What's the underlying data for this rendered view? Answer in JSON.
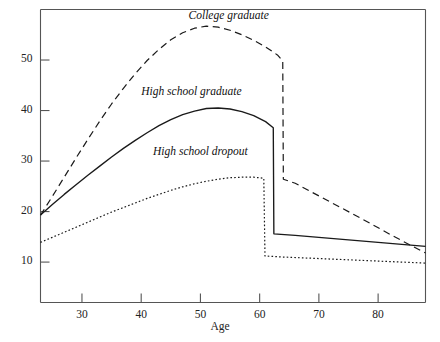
{
  "chart_data": {
    "type": "line",
    "title": "",
    "xlabel": "Age",
    "ylabel": "",
    "xlim": [
      23,
      88
    ],
    "ylim": [
      2,
      60
    ],
    "grid": false,
    "legend_position": "inline-annotations",
    "xticks": [
      30,
      40,
      50,
      60,
      70,
      80
    ],
    "xtick_labels": [
      "30",
      "40",
      "50",
      "60",
      "70",
      "80"
    ],
    "yticks": [
      10,
      20,
      30,
      40,
      50
    ],
    "ytick_labels": [
      "10",
      "20",
      "30",
      "40",
      "50"
    ],
    "series": [
      {
        "name": "College graduate",
        "style": "dashed",
        "label_x": 48,
        "label_y": 58.5,
        "points": [
          [
            23,
            19.3
          ],
          [
            25,
            23.0
          ],
          [
            27,
            26.8
          ],
          [
            29,
            30.6
          ],
          [
            31,
            34.3
          ],
          [
            33,
            37.9
          ],
          [
            35,
            41.3
          ],
          [
            37,
            44.4
          ],
          [
            39,
            47.3
          ],
          [
            41,
            49.9
          ],
          [
            43,
            52.1
          ],
          [
            45,
            54.0
          ],
          [
            47,
            55.4
          ],
          [
            49,
            56.3
          ],
          [
            51,
            56.7
          ],
          [
            53,
            56.5
          ],
          [
            55,
            55.9
          ],
          [
            57,
            55.0
          ],
          [
            59,
            53.9
          ],
          [
            61,
            52.6
          ],
          [
            63,
            51.0
          ],
          [
            63.9,
            49.8
          ],
          [
            64.0,
            26.4
          ],
          [
            66,
            25.6
          ],
          [
            70,
            23.1
          ],
          [
            74,
            20.6
          ],
          [
            78,
            18.1
          ],
          [
            82,
            15.5
          ],
          [
            86,
            13.0
          ],
          [
            88,
            11.8
          ]
        ]
      },
      {
        "name": "High school graduate",
        "style": "solid",
        "label_x": 40,
        "label_y": 43.5,
        "points": [
          [
            23,
            19.3
          ],
          [
            25,
            21.4
          ],
          [
            27,
            23.4
          ],
          [
            29,
            25.3
          ],
          [
            31,
            27.2
          ],
          [
            33,
            29.0
          ],
          [
            35,
            30.8
          ],
          [
            37,
            32.5
          ],
          [
            39,
            34.1
          ],
          [
            41,
            35.6
          ],
          [
            43,
            37.0
          ],
          [
            45,
            38.2
          ],
          [
            47,
            39.2
          ],
          [
            49,
            39.9
          ],
          [
            51,
            40.4
          ],
          [
            53,
            40.5
          ],
          [
            55,
            40.3
          ],
          [
            57,
            39.8
          ],
          [
            59,
            39.0
          ],
          [
            61,
            37.8
          ],
          [
            62.3,
            36.6
          ],
          [
            62.4,
            15.6
          ],
          [
            66,
            15.3
          ],
          [
            70,
            14.9
          ],
          [
            74,
            14.5
          ],
          [
            78,
            14.1
          ],
          [
            82,
            13.7
          ],
          [
            86,
            13.3
          ],
          [
            88,
            13.1
          ]
        ]
      },
      {
        "name": "High school dropout",
        "style": "dotted",
        "label_x": 42,
        "label_y": 31.5,
        "points": [
          [
            23,
            13.9
          ],
          [
            25,
            14.9
          ],
          [
            27,
            15.9
          ],
          [
            29,
            16.9
          ],
          [
            31,
            17.9
          ],
          [
            33,
            18.9
          ],
          [
            35,
            19.9
          ],
          [
            37,
            20.8
          ],
          [
            39,
            21.7
          ],
          [
            41,
            22.6
          ],
          [
            43,
            23.4
          ],
          [
            45,
            24.2
          ],
          [
            47,
            24.9
          ],
          [
            49,
            25.5
          ],
          [
            51,
            26.0
          ],
          [
            53,
            26.4
          ],
          [
            55,
            26.7
          ],
          [
            57,
            26.8
          ],
          [
            59,
            26.8
          ],
          [
            60.7,
            26.6
          ],
          [
            60.9,
            11.2
          ],
          [
            64,
            11.0
          ],
          [
            68,
            10.8
          ],
          [
            72,
            10.6
          ],
          [
            76,
            10.4
          ],
          [
            80,
            10.2
          ],
          [
            84,
            10.0
          ],
          [
            88,
            9.8
          ]
        ]
      }
    ]
  },
  "axis": {
    "x_title": "Age"
  },
  "colors": {
    "line": "#1a1a1a",
    "axis": "#555555",
    "background": "#ffffff"
  }
}
